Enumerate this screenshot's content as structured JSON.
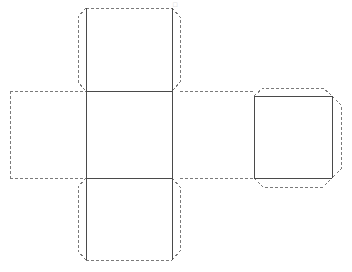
{
  "document": {
    "title": "Cube Net Template",
    "background_color": "#ffffff",
    "width": 352,
    "height": 272
  },
  "style": {
    "fold_line_color": "#4a4a4a",
    "cut_line_color": "#7a7a7a",
    "fold_line_width": 1,
    "cut_line_width": 1,
    "cut_dash_pattern": "3,2"
  },
  "diagram": {
    "kind": "cube-net",
    "panels": [
      {
        "id": "top-panel",
        "label": "Top Face",
        "x": 86,
        "y": 8,
        "width": 86,
        "height": 83,
        "flaps": [
          "left",
          "right",
          "top"
        ]
      },
      {
        "id": "center-panel",
        "label": "Front Face",
        "x": 86,
        "y": 91,
        "width": 86,
        "height": 87,
        "flaps": []
      },
      {
        "id": "bottom-panel",
        "label": "Bottom Face",
        "x": 86,
        "y": 178,
        "width": 86,
        "height": 82,
        "flaps": [
          "left",
          "right",
          "bottom"
        ]
      },
      {
        "id": "left-panel",
        "label": "Left Face",
        "x": 10,
        "y": 91,
        "width": 76,
        "height": 87,
        "flaps": []
      },
      {
        "id": "right-panel",
        "label": "Back Face",
        "x": 254,
        "y": 96,
        "width": 78,
        "height": 82,
        "flaps": [
          "top",
          "right",
          "bottom"
        ]
      },
      {
        "id": "connector-panel",
        "label": "Right Face",
        "x": 172,
        "y": 91,
        "width": 82,
        "height": 87,
        "flaps": []
      }
    ],
    "flap_depth": 14,
    "flap_corner_inset": 9,
    "artifact_glyph": "□"
  }
}
